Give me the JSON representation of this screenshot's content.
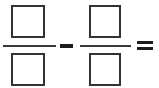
{
  "worksheet": {
    "type": "fraction-subtraction-problem",
    "expression": "□/□ - □/□ =",
    "operators": {
      "subtraction_symbol": "−",
      "equals_symbol": "="
    },
    "colors": {
      "background": "#ffffff",
      "box_border": "#333333",
      "fraction_bar": "#3a3a3a",
      "operator": "#1c1c1c"
    },
    "fractions": [
      {
        "position": "left",
        "numerator_value": "",
        "denominator_value": "",
        "numerator_placeholder": "",
        "denominator_placeholder": ""
      },
      {
        "position": "right",
        "numerator_value": "",
        "denominator_value": "",
        "numerator_placeholder": "",
        "denominator_placeholder": ""
      }
    ],
    "result": {
      "value": "",
      "placeholder": ""
    }
  }
}
